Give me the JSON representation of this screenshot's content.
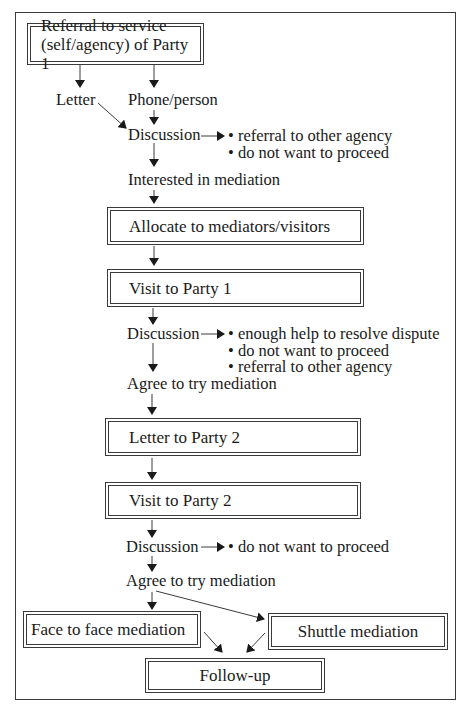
{
  "flowchart": {
    "start": {
      "line1": "Referral to service",
      "line2": "(self/agency) of Party 1"
    },
    "channels": {
      "letter": "Letter",
      "phone": "Phone/person"
    },
    "discussion1": {
      "label": "Discussion",
      "outcomes": [
        "referral to other agency",
        "do not want to proceed"
      ]
    },
    "interested": "Interested in mediation",
    "allocate": "Allocate to mediators/visitors",
    "visit_party1": "Visit to Party 1",
    "discussion2": {
      "label": "Discussion",
      "outcomes": [
        "enough help to resolve dispute",
        "do not want to proceed",
        "referral to other agency"
      ]
    },
    "agree1": "Agree to try mediation",
    "letter_party2": "Letter to Party 2",
    "visit_party2": "Visit to Party 2",
    "discussion3": {
      "label": "Discussion",
      "outcomes": [
        "do not want to proceed"
      ]
    },
    "agree2": "Agree to try mediation",
    "face_to_face": "Face to face mediation",
    "shuttle": "Shuttle mediation",
    "follow_up": "Follow-up"
  },
  "colors": {
    "line": "#3a3a3a",
    "background": "#ffffff",
    "text": "#1a1a1a"
  }
}
